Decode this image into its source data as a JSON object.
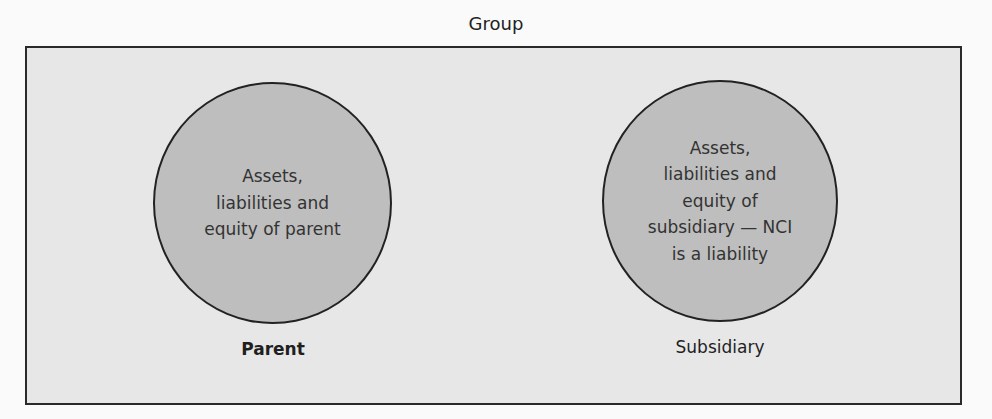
{
  "diagram": {
    "title": "Group",
    "colors": {
      "page_background": "#fafafa",
      "group_box_fill": "#e7e7e7",
      "group_box_border": "#2a2a2a",
      "circle_fill": "#bebebe",
      "circle_border": "#222222",
      "text": "#2b2b2b"
    },
    "entities": [
      {
        "id": "parent",
        "label": "Parent",
        "description_lines": [
          "Assets,",
          "liabilities and",
          "equity of parent"
        ]
      },
      {
        "id": "subsidiary",
        "label": "Subsidiary",
        "description_lines": [
          "Assets,",
          "liabilities and",
          "equity of",
          "subsidiary — NCI",
          "is a liability"
        ]
      }
    ]
  }
}
